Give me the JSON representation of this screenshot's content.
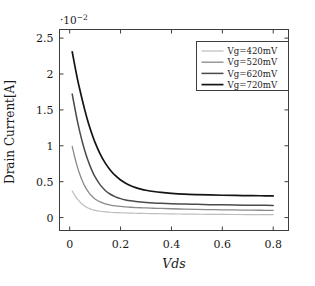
{
  "chart_data": {
    "type": "line",
    "title": "",
    "xlabel": "Vds",
    "ylabel": "Drain Current[A]",
    "y_exponent_label": "·10−2",
    "y_exponent_base": "·10",
    "y_exponent_sup": "−2",
    "xlim": [
      -0.04,
      0.86
    ],
    "ylim": [
      -0.18,
      2.62
    ],
    "y_scale": 0.01,
    "xticks": [
      0,
      0.2,
      0.4,
      0.6,
      0.8
    ],
    "xtick_labels": [
      "0",
      "0.2",
      "0.4",
      "0.6",
      "0.8"
    ],
    "yticks": [
      0,
      0.5,
      1,
      1.5,
      2,
      2.5
    ],
    "ytick_labels": [
      "0",
      "0.5",
      "1",
      "1.5",
      "2",
      "2.5"
    ],
    "grid": false,
    "legend_position": "upper right",
    "x": [
      0.01,
      0.02,
      0.03,
      0.04,
      0.05,
      0.06,
      0.07,
      0.08,
      0.09,
      0.1,
      0.12,
      0.14,
      0.16,
      0.18,
      0.2,
      0.22,
      0.24,
      0.26,
      0.28,
      0.3,
      0.33,
      0.36,
      0.4,
      0.45,
      0.5,
      0.55,
      0.6,
      0.65,
      0.7,
      0.75,
      0.8
    ],
    "series": [
      {
        "name": "Vg=420mV",
        "label": "Vg=420mV",
        "color": "#bdbdbd",
        "width": 1.2,
        "values": [
          0.37,
          0.31,
          0.26,
          0.22,
          0.185,
          0.158,
          0.137,
          0.121,
          0.109,
          0.1,
          0.088,
          0.08,
          0.074,
          0.07,
          0.067,
          0.064,
          0.062,
          0.06,
          0.058,
          0.057,
          0.055,
          0.053,
          0.051,
          0.049,
          0.047,
          0.045,
          0.044,
          0.043,
          0.042,
          0.041,
          0.04
        ]
      },
      {
        "name": "Vg=520mV",
        "label": "Vg=520mV",
        "color": "#8a8a8a",
        "width": 1.3,
        "values": [
          0.99,
          0.84,
          0.71,
          0.6,
          0.51,
          0.435,
          0.375,
          0.327,
          0.289,
          0.259,
          0.218,
          0.192,
          0.175,
          0.163,
          0.155,
          0.149,
          0.144,
          0.14,
          0.137,
          0.134,
          0.13,
          0.127,
          0.123,
          0.118,
          0.114,
          0.111,
          0.108,
          0.106,
          0.104,
          0.102,
          0.1
        ]
      },
      {
        "name": "Vg=620mV",
        "label": "Vg=620mV",
        "color": "#4a4a4a",
        "width": 1.5,
        "values": [
          1.72,
          1.53,
          1.35,
          1.19,
          1.05,
          0.925,
          0.815,
          0.72,
          0.637,
          0.566,
          0.455,
          0.378,
          0.325,
          0.289,
          0.264,
          0.246,
          0.233,
          0.224,
          0.217,
          0.211,
          0.204,
          0.199,
          0.194,
          0.188,
          0.184,
          0.18,
          0.177,
          0.175,
          0.173,
          0.171,
          0.17
        ]
      },
      {
        "name": "Vg=720mV",
        "label": "Vg=720mV",
        "color": "#141414",
        "width": 1.7,
        "values": [
          2.31,
          2.12,
          1.94,
          1.78,
          1.63,
          1.49,
          1.36,
          1.245,
          1.14,
          1.045,
          0.885,
          0.758,
          0.66,
          0.583,
          0.524,
          0.479,
          0.444,
          0.417,
          0.397,
          0.381,
          0.363,
          0.35,
          0.338,
          0.327,
          0.32,
          0.315,
          0.311,
          0.308,
          0.306,
          0.304,
          0.302
        ]
      }
    ]
  },
  "legend": {
    "entries": [
      {
        "label": "Vg=420mV"
      },
      {
        "label": "Vg=520mV"
      },
      {
        "label": "Vg=620mV"
      },
      {
        "label": "Vg=720mV"
      }
    ]
  }
}
